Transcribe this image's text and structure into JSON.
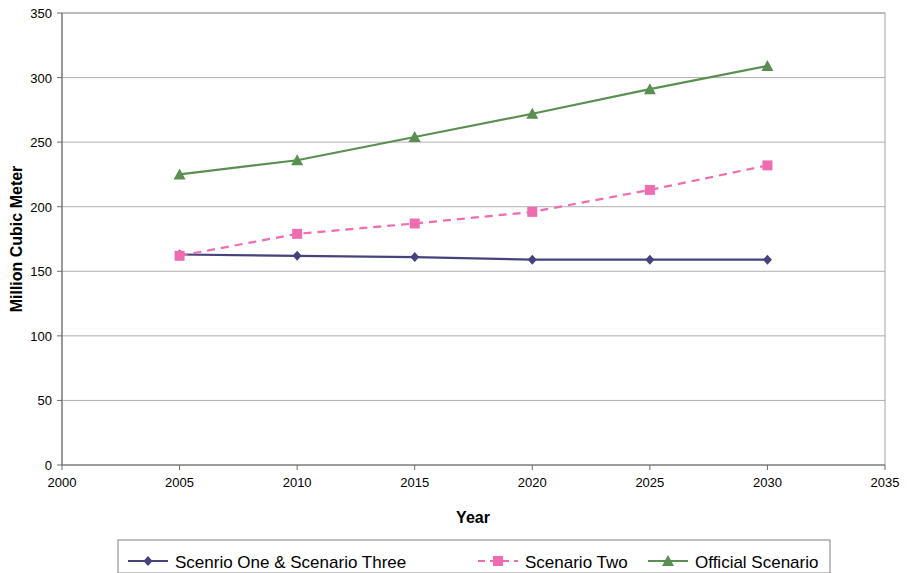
{
  "chart_data": {
    "type": "line",
    "title": "",
    "xlabel": "Year",
    "ylabel": "Million Cubic Meter",
    "x": [
      2005,
      2010,
      2015,
      2020,
      2025,
      2030
    ],
    "xlim": [
      2000,
      2035
    ],
    "ylim": [
      0,
      350
    ],
    "xticks": [
      "2000",
      "2005",
      "2010",
      "2015",
      "2020",
      "2025",
      "2030",
      "2035"
    ],
    "yticks": [
      "0",
      "50",
      "100",
      "150",
      "200",
      "250",
      "300",
      "350"
    ],
    "grid": true,
    "legend_position": "bottom",
    "series": [
      {
        "name": "Scenrio One & Scenario Three",
        "color": "#46427d",
        "marker": "diamond",
        "dash": "solid",
        "values": [
          163,
          162,
          161,
          159,
          159,
          159
        ]
      },
      {
        "name": "Scenario Two",
        "color": "#f06cb0",
        "marker": "square",
        "dash": "dashed",
        "values": [
          162,
          179,
          187,
          196,
          213,
          232
        ]
      },
      {
        "name": "Official Scenario",
        "color": "#5b8f52",
        "marker": "triangle",
        "dash": "solid",
        "values": [
          225,
          236,
          254,
          272,
          291,
          309
        ]
      }
    ]
  },
  "axis": {
    "x_title": "Year",
    "y_title": "Million Cubic Meter"
  },
  "legend": {
    "items": [
      {
        "label": "Scenrio One & Scenario Three",
        "color": "#46427d",
        "marker": "diamond",
        "dash": "solid"
      },
      {
        "label": "Scenario Two",
        "color": "#f06cb0",
        "marker": "square",
        "dash": "dashed"
      },
      {
        "label": "Official Scenario",
        "color": "#5b8f52",
        "marker": "triangle",
        "dash": "solid"
      }
    ]
  }
}
